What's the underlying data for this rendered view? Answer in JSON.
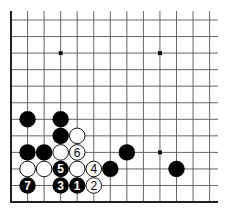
{
  "diagram": {
    "type": "go-board-fragment",
    "corner": "bottom-left",
    "grid": {
      "origin_x": 11,
      "origin_y": 20,
      "spacing": 16.55,
      "columns": 13,
      "rows": 12,
      "right_extent": 218,
      "top_extent": 11,
      "left_edge": true,
      "bottom_edge": true
    },
    "star_points": [
      {
        "col": 3,
        "row": 2
      },
      {
        "col": 9,
        "row": 2
      },
      {
        "col": 9,
        "row": 8
      }
    ],
    "stones": [
      {
        "color": "black",
        "col": 1,
        "row": 6,
        "label": ""
      },
      {
        "color": "black",
        "col": 3,
        "row": 6,
        "label": ""
      },
      {
        "color": "black",
        "col": 3,
        "row": 7,
        "label": ""
      },
      {
        "color": "white",
        "col": 4,
        "row": 7,
        "label": ""
      },
      {
        "color": "black",
        "col": 1,
        "row": 8,
        "label": ""
      },
      {
        "color": "black",
        "col": 2,
        "row": 8,
        "label": ""
      },
      {
        "color": "white",
        "col": 3,
        "row": 8,
        "label": ""
      },
      {
        "color": "white",
        "col": 4,
        "row": 8,
        "label": "6"
      },
      {
        "color": "black",
        "col": 7,
        "row": 8,
        "label": ""
      },
      {
        "color": "white",
        "col": 1,
        "row": 9,
        "label": ""
      },
      {
        "color": "white",
        "col": 2,
        "row": 9,
        "label": ""
      },
      {
        "color": "black",
        "col": 3,
        "row": 9,
        "label": "5"
      },
      {
        "color": "white",
        "col": 4,
        "row": 9,
        "label": ""
      },
      {
        "color": "white",
        "col": 5,
        "row": 9,
        "label": "4"
      },
      {
        "color": "black",
        "col": 6,
        "row": 9,
        "label": ""
      },
      {
        "color": "black",
        "col": 10,
        "row": 9,
        "label": ""
      },
      {
        "color": "black",
        "col": 1,
        "row": 10,
        "label": "7"
      },
      {
        "color": "black",
        "col": 3,
        "row": 10,
        "label": "3"
      },
      {
        "color": "black",
        "col": 4,
        "row": 10,
        "label": "1"
      },
      {
        "color": "white",
        "col": 5,
        "row": 10,
        "label": "2"
      }
    ],
    "colors": {
      "board": "#ffffff",
      "lines": "#555555",
      "edge": "#222222",
      "black_stone": "#000000",
      "white_stone": "#ffffff"
    }
  }
}
